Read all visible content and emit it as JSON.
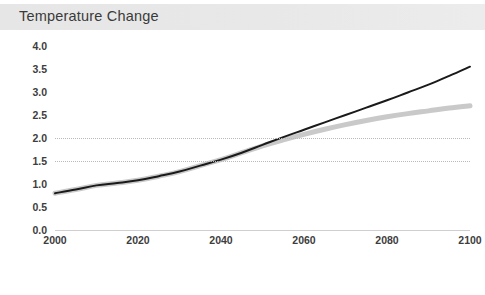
{
  "header": {
    "title": "Temperature Change"
  },
  "chart_data": {
    "type": "line",
    "title": "Temperature Change",
    "xlabel": "",
    "ylabel": "Degrees Celsius",
    "xlim": [
      2000,
      2100
    ],
    "ylim": [
      0.0,
      4.0
    ],
    "ytick_labels": [
      "0.0",
      "0.5",
      "1.0",
      "1.5",
      "2.0",
      "2.5",
      "3.0",
      "3.5",
      "4.0"
    ],
    "ytick_values": [
      0.0,
      0.5,
      1.0,
      1.5,
      2.0,
      2.5,
      3.0,
      3.5,
      4.0
    ],
    "xtick_labels": [
      "2000",
      "2020",
      "2040",
      "2060",
      "2080",
      "2100"
    ],
    "xtick_values": [
      2000,
      2020,
      2040,
      2060,
      2080,
      2100
    ],
    "grid": "horizontal-dotted-partial",
    "gridline_values": [
      1.5,
      2.0
    ],
    "legend": "none",
    "x": [
      2000,
      2005,
      2010,
      2015,
      2020,
      2025,
      2030,
      2035,
      2040,
      2045,
      2050,
      2055,
      2060,
      2065,
      2070,
      2075,
      2080,
      2085,
      2090,
      2095,
      2100
    ],
    "series": [
      {
        "name": "high-emissions",
        "color": "#1a1a1a",
        "line_width": 2,
        "values": [
          0.8,
          0.88,
          0.97,
          1.02,
          1.08,
          1.17,
          1.27,
          1.4,
          1.53,
          1.68,
          1.85,
          2.02,
          2.18,
          2.34,
          2.5,
          2.66,
          2.82,
          2.99,
          3.16,
          3.35,
          3.55
        ]
      },
      {
        "name": "mitigation",
        "color": "#c9c9c9",
        "line_width": 5,
        "values": [
          0.8,
          0.88,
          0.97,
          1.02,
          1.08,
          1.17,
          1.27,
          1.4,
          1.53,
          1.68,
          1.83,
          1.96,
          2.08,
          2.19,
          2.29,
          2.38,
          2.46,
          2.53,
          2.59,
          2.65,
          2.7
        ]
      }
    ]
  },
  "colors": {
    "title_band": "#e8e8e8",
    "title_text": "#3a3a3a",
    "tick_text": "#3d3d3d",
    "gridline": "#b9b9b9",
    "axis": "#cfcfcf"
  }
}
